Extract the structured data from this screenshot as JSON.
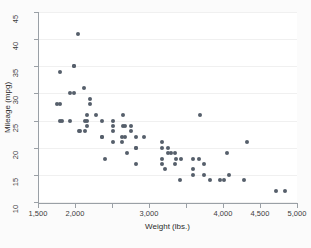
{
  "chart_data": {
    "type": "scatter",
    "title": "",
    "xlabel": "Weight (lbs.)",
    "ylabel": "Mileage (mpg)",
    "xlim": [
      1500,
      5000
    ],
    "ylim": [
      10,
      45
    ],
    "grid": true,
    "legend": "none",
    "marker_color": "#565f6b",
    "x_ticks": [
      1500,
      2000,
      2500,
      3000,
      3500,
      4000,
      4500,
      5000
    ],
    "x_tick_labels": [
      "1,500",
      "2,000",
      "",
      "3,000",
      "",
      "4,000",
      "4,500",
      "5,000"
    ],
    "y_ticks": [
      10,
      15,
      20,
      25,
      30,
      35,
      40,
      45
    ],
    "y_tick_labels": [
      "10",
      "15",
      "20",
      "25",
      "30",
      "35",
      "40",
      "45"
    ],
    "n_points": 74,
    "series": [
      {
        "name": "Mileage (mpg) vs Weight (lbs.)",
        "points": [
          [
            2930,
            22
          ],
          [
            3350,
            17
          ],
          [
            2640,
            22
          ],
          [
            3250,
            20
          ],
          [
            4080,
            15
          ],
          [
            3670,
            18
          ],
          [
            3690,
            26
          ],
          [
            3180,
            20
          ],
          [
            3220,
            16
          ],
          [
            4060,
            19
          ],
          [
            3600,
            15
          ],
          [
            3600,
            18
          ],
          [
            3740,
            15
          ],
          [
            4840,
            12
          ],
          [
            4720,
            12
          ],
          [
            3955,
            14
          ],
          [
            3830,
            14
          ],
          [
            4010,
            14
          ],
          [
            5140,
            14
          ],
          [
            4330,
            21
          ],
          [
            4290,
            14
          ],
          [
            3350,
            19
          ],
          [
            3360,
            18
          ],
          [
            2700,
            19
          ],
          [
            2750,
            24
          ],
          [
            2280,
            26
          ],
          [
            3430,
            18
          ],
          [
            3180,
            21
          ],
          [
            2200,
            28
          ],
          [
            2520,
            25
          ],
          [
            2650,
            26
          ],
          [
            1800,
            34
          ],
          [
            1800,
            25
          ],
          [
            1930,
            30
          ],
          [
            1990,
            35
          ],
          [
            2520,
            21
          ],
          [
            2130,
            25
          ],
          [
            2650,
            24
          ],
          [
            1760,
            28
          ],
          [
            2050,
            23
          ],
          [
            2410,
            18
          ],
          [
            2670,
            24
          ],
          [
            2370,
            22
          ],
          [
            2830,
            20
          ],
          [
            2200,
            29
          ],
          [
            2520,
            23
          ],
          [
            2160,
            26
          ],
          [
            2670,
            22
          ],
          [
            1980,
            35
          ],
          [
            1800,
            28
          ],
          [
            2160,
            24
          ],
          [
            2370,
            25
          ],
          [
            2120,
            31
          ],
          [
            2520,
            24
          ],
          [
            1980,
            30
          ],
          [
            2830,
            17
          ],
          [
            3170,
            17
          ],
          [
            3740,
            17
          ],
          [
            3260,
            19
          ],
          [
            3600,
            16
          ],
          [
            3420,
            14
          ],
          [
            2750,
            23
          ],
          [
            2130,
            23
          ],
          [
            1930,
            25
          ],
          [
            2640,
            21
          ],
          [
            2830,
            22
          ],
          [
            1830,
            25
          ],
          [
            2040,
            41
          ],
          [
            2160,
            25
          ],
          [
            2070,
            23
          ],
          [
            2370,
            22
          ],
          [
            2830,
            20
          ],
          [
            3300,
            19
          ],
          [
            3170,
            18
          ]
        ]
      }
    ]
  },
  "axes": {
    "y_title": "Mileage (mpg)",
    "x_title": "Weight (lbs.)"
  }
}
